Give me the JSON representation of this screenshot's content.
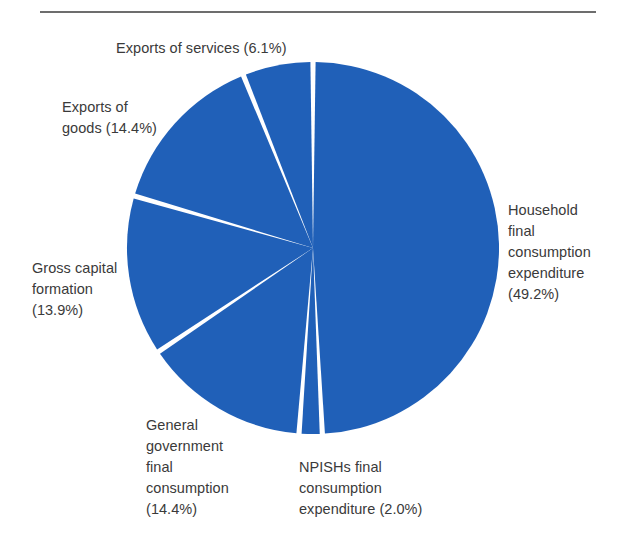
{
  "figure": {
    "name": "pie-chart-final-expenditure",
    "background_color": "#ffffff",
    "rule_color": "#6d6d6d",
    "text_color": "#3a3a3a"
  },
  "labels": {
    "exports_of_services": "Exports of services (6.1%)",
    "exports_of_goods": "Exports of\ngoods (14.4%)",
    "gross_capital_formation": "Gross capital\nformation\n(13.9%)",
    "general_government": "General\ngovernment\nfinal\nconsumption\n(14.4%)",
    "npishs": "NPISHs final\nconsumption\nexpenditure (2.0%)",
    "household": "Household\nfinal\nconsumption\nexpenditure\n(49.2%)"
  },
  "chart_data": {
    "type": "pie",
    "title": "",
    "xlabel": "",
    "ylabel": "",
    "legend_position": "none",
    "grid": false,
    "units": "percent",
    "total": 100.0,
    "start_angle_deg": 0,
    "direction": "clockwise",
    "slice_gap_deg": 1.6,
    "center": {
      "x": 313,
      "y": 248
    },
    "radius": 186,
    "slice_color": "#2060b8",
    "separator_color": "#ffffff",
    "categories": [
      "Household final consumption expenditure",
      "NPISHs final consumption expenditure",
      "General government final consumption",
      "Gross capital formation",
      "Exports of goods",
      "Exports of services"
    ],
    "values": [
      49.2,
      2.0,
      14.4,
      13.9,
      14.4,
      6.1
    ],
    "slices": [
      {
        "label": "Household final consumption expenditure",
        "value": 49.2,
        "color": "#2060b8"
      },
      {
        "label": "NPISHs final consumption expenditure",
        "value": 2.0,
        "color": "#2060b8"
      },
      {
        "label": "General government final consumption",
        "value": 14.4,
        "color": "#2060b8"
      },
      {
        "label": "Gross capital formation",
        "value": 13.9,
        "color": "#2060b8"
      },
      {
        "label": "Exports of goods",
        "value": 14.4,
        "color": "#2060b8"
      },
      {
        "label": "Exports of services",
        "value": 6.1,
        "color": "#2060b8"
      }
    ]
  }
}
